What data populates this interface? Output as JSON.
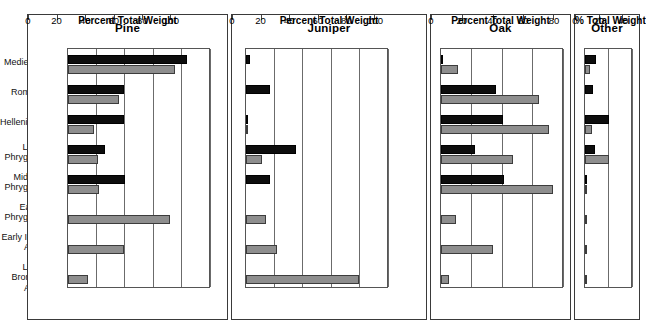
{
  "figure": {
    "categories": [
      "Medieval",
      "Roman",
      "Hellenistic",
      "Late\nPhrygian",
      "Middle\nPhrygian",
      "Early\nPhrygian",
      "Early Iron\nAge",
      "Late Bronze\nAge"
    ],
    "series_names": [
      "Black series",
      "Gray series"
    ],
    "colors": {
      "black": "#0d0d0d",
      "gray": "#8e8e8e",
      "frame": "#3a3a3a",
      "grid": "#6b6b6b"
    }
  },
  "panels": [
    {
      "title": "Pine",
      "xlabel": "Percent Total Weight",
      "xlim": [
        0,
        100
      ],
      "xticks": [
        0,
        20,
        40,
        60,
        80,
        100
      ],
      "xticklabels": [
        "0",
        "20",
        "40",
        "60",
        "80",
        "100"
      ],
      "black": [
        83,
        39,
        39,
        26,
        40,
        0,
        0,
        0
      ],
      "gray": [
        75,
        36,
        18,
        21,
        22,
        71,
        39,
        14
      ]
    },
    {
      "title": "Juniper",
      "xlabel": "Percent Total Weight",
      "xlim": [
        0,
        100
      ],
      "xticks": [
        0,
        20,
        40,
        60,
        80,
        100
      ],
      "xticklabels": [
        "0",
        "20",
        "40",
        "60",
        "80",
        "100"
      ],
      "black": [
        3,
        17,
        1,
        35,
        17,
        0,
        0,
        0
      ],
      "gray": [
        0,
        0,
        1,
        11,
        0,
        14,
        22,
        79
      ]
    },
    {
      "title": "Oak",
      "xlabel": "Percent Total Weight",
      "xlim": [
        0,
        80
      ],
      "xticks": [
        0,
        20,
        40,
        60,
        80
      ],
      "xticklabels": [
        "0",
        "20",
        "40",
        "60",
        "80"
      ],
      "black": [
        1,
        36,
        40,
        22,
        41,
        0,
        0,
        0
      ],
      "gray": [
        11,
        64,
        70,
        47,
        73,
        10,
        34,
        5
      ]
    },
    {
      "title": "Other",
      "xlabel": "% Total Weight",
      "xlim": [
        0,
        40
      ],
      "xticks": [
        0,
        20,
        40
      ],
      "xticklabels": [
        "0",
        "20",
        "40"
      ],
      "black": [
        9,
        7,
        20,
        8,
        2,
        0,
        0,
        0
      ],
      "gray": [
        4,
        0,
        6,
        20,
        2,
        2,
        1,
        2
      ]
    }
  ],
  "chart_data": {
    "type": "bar",
    "title": "",
    "orientation": "horizontal",
    "grid": true,
    "legend_position": "none",
    "categories": [
      "Medieval",
      "Roman",
      "Hellenistic",
      "Late Phrygian",
      "Middle Phrygian",
      "Early Phrygian",
      "Early Iron Age",
      "Late Bronze Age"
    ],
    "panels": [
      {
        "name": "Pine",
        "xlabel": "Percent Total Weight",
        "xlim": [
          0,
          100
        ],
        "series": [
          {
            "name": "black",
            "values": [
              83,
              39,
              39,
              26,
              40,
              0,
              0,
              0
            ]
          },
          {
            "name": "gray",
            "values": [
              75,
              36,
              18,
              21,
              22,
              71,
              39,
              14
            ]
          }
        ]
      },
      {
        "name": "Juniper",
        "xlabel": "Percent Total Weight",
        "xlim": [
          0,
          100
        ],
        "series": [
          {
            "name": "black",
            "values": [
              3,
              17,
              1,
              35,
              17,
              0,
              0,
              0
            ]
          },
          {
            "name": "gray",
            "values": [
              0,
              0,
              1,
              11,
              0,
              14,
              22,
              79
            ]
          }
        ]
      },
      {
        "name": "Oak",
        "xlabel": "Percent Total Weight",
        "xlim": [
          0,
          80
        ],
        "series": [
          {
            "name": "black",
            "values": [
              1,
              36,
              40,
              22,
              41,
              0,
              0,
              0
            ]
          },
          {
            "name": "gray",
            "values": [
              11,
              64,
              70,
              47,
              73,
              10,
              34,
              5
            ]
          }
        ]
      },
      {
        "name": "Other",
        "xlabel": "% Total Weight",
        "xlim": [
          0,
          40
        ],
        "series": [
          {
            "name": "black",
            "values": [
              9,
              7,
              20,
              8,
              2,
              0,
              0,
              0
            ]
          },
          {
            "name": "gray",
            "values": [
              4,
              0,
              6,
              20,
              2,
              2,
              1,
              2
            ]
          }
        ]
      }
    ]
  }
}
